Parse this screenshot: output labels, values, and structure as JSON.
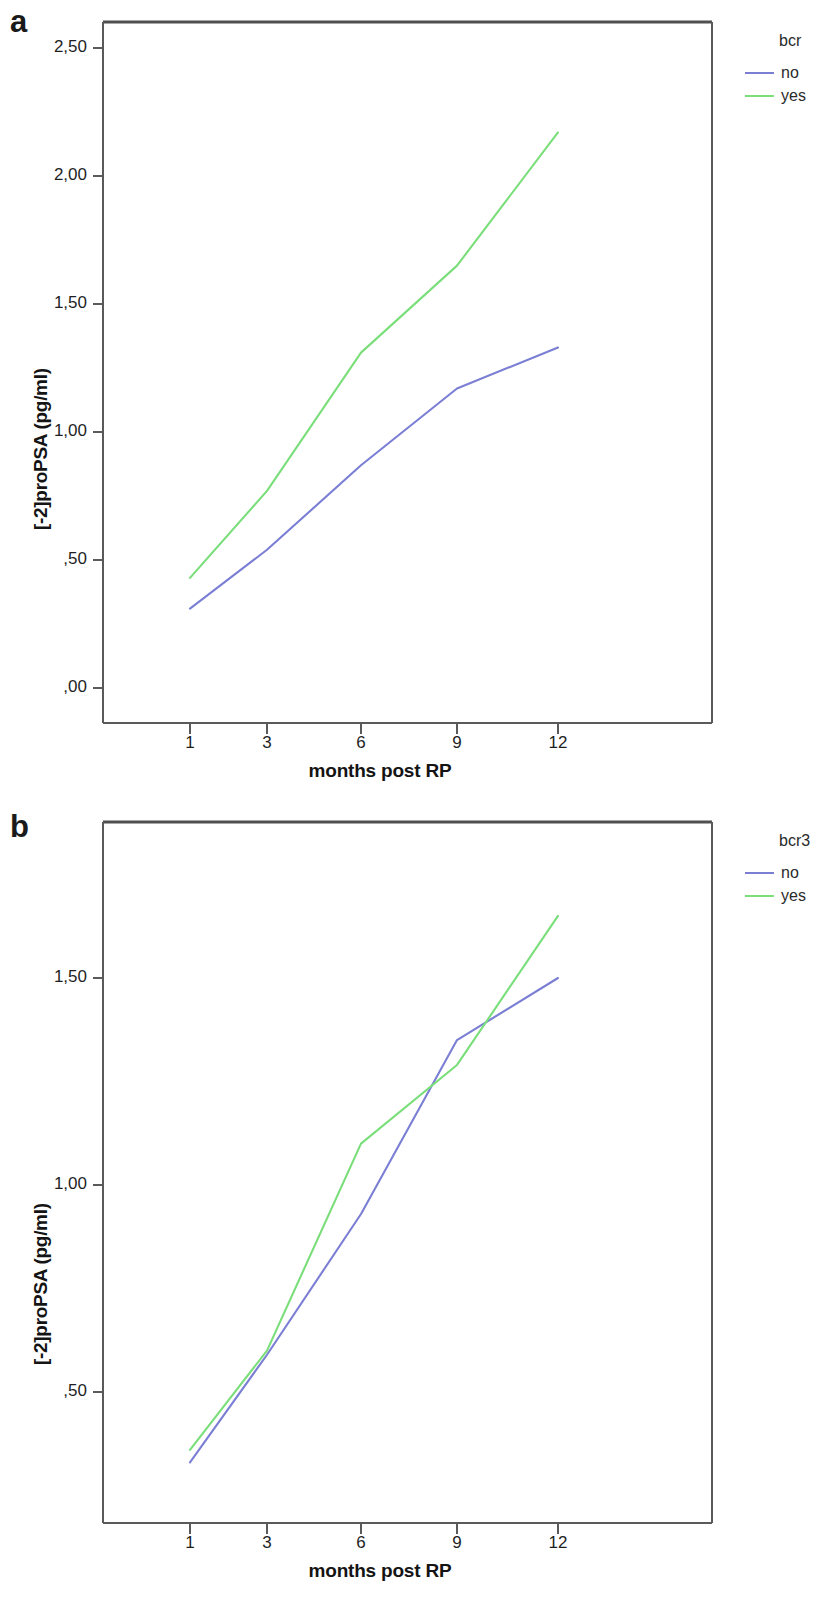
{
  "figure": {
    "panels": [
      {
        "letter": "a",
        "legend": {
          "title": "bcr",
          "entries": [
            {
              "label": "no",
              "color": "#7b7fd4"
            },
            {
              "label": "yes",
              "color": "#7ade7a"
            }
          ]
        }
      },
      {
        "letter": "b",
        "legend": {
          "title": "bcr3",
          "entries": [
            {
              "label": "no",
              "color": "#7b7fd4"
            },
            {
              "label": "yes",
              "color": "#7ade7a"
            }
          ]
        }
      }
    ]
  },
  "chart_data": [
    {
      "type": "line",
      "title": "a",
      "xlabel": "months post RP",
      "ylabel": "[-2]proPSA (pg/ml)",
      "categories": [
        "1",
        "3",
        "6",
        "9",
        "12"
      ],
      "x": [
        1,
        3,
        6,
        9,
        12
      ],
      "ytick_labels": [
        ",00",
        ",50",
        "1,00",
        "1,50",
        "2,00",
        "2,50"
      ],
      "ytick_values": [
        0.0,
        0.5,
        1.0,
        1.5,
        2.0,
        2.5
      ],
      "ylim": [
        -0.04,
        2.61
      ],
      "grid": false,
      "legend_title": "bcr",
      "legend_position": "right",
      "series": [
        {
          "name": "no",
          "color": "#7b7fd4",
          "values": [
            0.31,
            0.54,
            0.87,
            1.17,
            1.33
          ]
        },
        {
          "name": "yes",
          "color": "#7ade7a",
          "values": [
            0.43,
            0.77,
            1.31,
            1.65,
            2.17
          ]
        }
      ]
    },
    {
      "type": "line",
      "title": "b",
      "xlabel": "months post RP",
      "ylabel": "[-2]proPSA (pg/ml)",
      "categories": [
        "1",
        "3",
        "6",
        "9",
        "12"
      ],
      "x": [
        1,
        3,
        6,
        9,
        12
      ],
      "ytick_labels": [
        ",50",
        "1,00",
        "1,50"
      ],
      "ytick_values": [
        0.5,
        1.0,
        1.5
      ],
      "ylim": [
        0.22,
        1.73
      ],
      "grid": false,
      "legend_title": "bcr3",
      "legend_position": "right",
      "series": [
        {
          "name": "no",
          "color": "#7b7fd4",
          "values": [
            0.33,
            0.59,
            0.93,
            1.35,
            1.5
          ]
        },
        {
          "name": "yes",
          "color": "#7ade7a",
          "values": [
            0.36,
            0.6,
            1.1,
            1.29,
            1.65
          ]
        }
      ]
    }
  ]
}
